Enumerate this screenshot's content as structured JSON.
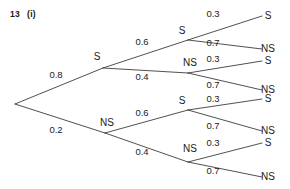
{
  "header": {
    "question_number": "13",
    "part": "(i)"
  },
  "chart_data": {
    "type": "diagram",
    "diagram_kind": "probability-tree",
    "levels": 3,
    "outcome_labels": [
      "S",
      "NS"
    ],
    "root": {
      "name": "root",
      "x": 15,
      "y": 104
    },
    "nodes": [
      {
        "id": "n-S",
        "label": "S",
        "x": 103,
        "y": 68,
        "label_x": 97,
        "label_y": 60,
        "prob": "0.8",
        "prob_x": 56,
        "prob_y": 78,
        "parent": "root"
      },
      {
        "id": "n-NS",
        "label": "NS",
        "x": 105,
        "y": 133,
        "label_x": 107,
        "label_y": 126,
        "prob": "0.2",
        "prob_x": 56,
        "prob_y": 133,
        "parent": "root"
      },
      {
        "id": "n-S-S",
        "label": "S",
        "x": 188,
        "y": 40,
        "label_x": 182,
        "label_y": 34,
        "prob": "0.6",
        "prob_x": 142,
        "prob_y": 45,
        "parent": "n-S"
      },
      {
        "id": "n-S-NS",
        "label": "NS",
        "x": 188,
        "y": 73,
        "label_x": 190,
        "label_y": 66,
        "prob": "0.4",
        "prob_x": 142,
        "prob_y": 80,
        "parent": "n-S"
      },
      {
        "id": "n-NS-S",
        "label": "S",
        "x": 188,
        "y": 110,
        "label_x": 182,
        "label_y": 104,
        "prob": "0.6",
        "prob_x": 142,
        "prob_y": 116,
        "parent": "n-NS"
      },
      {
        "id": "n-NS-NS",
        "label": "NS",
        "x": 188,
        "y": 162,
        "label_x": 190,
        "label_y": 152,
        "prob": "0.4",
        "prob_x": 142,
        "prob_y": 155,
        "parent": "n-NS"
      }
    ],
    "leaves": [
      {
        "id": "leaf-SSS",
        "label": "S",
        "x": 262,
        "y": 16,
        "label_x": 268,
        "label_y": 19,
        "prob": "0.3",
        "prob_x": 213,
        "prob_y": 17,
        "parent": "n-S-S"
      },
      {
        "id": "leaf-SSNS",
        "label": "NS",
        "x": 262,
        "y": 49,
        "label_x": 268,
        "label_y": 52,
        "prob": "0.7",
        "prob_x": 213,
        "prob_y": 46,
        "parent": "n-S-S"
      },
      {
        "id": "leaf-SNSS",
        "label": "S",
        "x": 262,
        "y": 61,
        "label_x": 268,
        "label_y": 64,
        "prob": "0.3",
        "prob_x": 213,
        "prob_y": 62,
        "parent": "n-S-NS"
      },
      {
        "id": "leaf-SNSNS",
        "label": "NS",
        "x": 262,
        "y": 90,
        "label_x": 268,
        "label_y": 93,
        "prob": "0.7",
        "prob_x": 213,
        "prob_y": 88,
        "parent": "n-S-NS"
      },
      {
        "id": "leaf-NSSS",
        "label": "S",
        "x": 262,
        "y": 99,
        "label_x": 268,
        "label_y": 102,
        "prob": "0.3",
        "prob_x": 213,
        "prob_y": 102,
        "parent": "n-NS-S"
      },
      {
        "id": "leaf-NSSNS",
        "label": "NS",
        "x": 262,
        "y": 131,
        "label_x": 268,
        "label_y": 134,
        "prob": "0.7",
        "prob_x": 213,
        "prob_y": 129,
        "parent": "n-NS-S"
      },
      {
        "id": "leaf-NSNSS",
        "label": "S",
        "x": 262,
        "y": 143,
        "label_x": 268,
        "label_y": 146,
        "prob": "0.3",
        "prob_x": 213,
        "prob_y": 146,
        "parent": "n-NS-NS"
      },
      {
        "id": "leaf-NSNSNS",
        "label": "NS",
        "x": 262,
        "y": 177,
        "label_x": 268,
        "label_y": 180,
        "prob": "0.7",
        "prob_x": 213,
        "prob_y": 174,
        "parent": "n-NS-NS"
      }
    ],
    "colors": {
      "line": "#3c3c3c",
      "text": "#1a1a1a",
      "background": "#ffffff"
    }
  }
}
